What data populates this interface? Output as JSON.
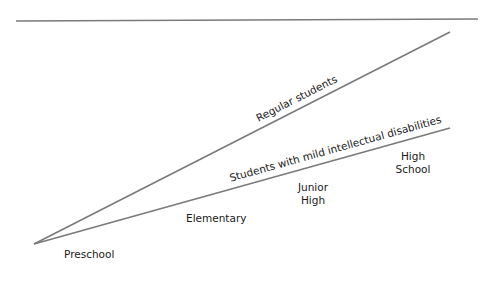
{
  "diagram": {
    "line_color": "#7a7a7a",
    "lines": [
      {
        "name": "Regular students",
        "label": "Regular students"
      },
      {
        "name": "Students with mild intellectual disabilities",
        "label": "Students with mild intellectual disabilities"
      }
    ],
    "stages": [
      {
        "name": "preschool",
        "lines": [
          "Preschool"
        ]
      },
      {
        "name": "elementary",
        "lines": [
          "Elementary"
        ]
      },
      {
        "name": "junior-high",
        "lines": [
          "Junior",
          "High"
        ]
      },
      {
        "name": "high-school",
        "lines": [
          "High",
          "School"
        ]
      }
    ]
  }
}
